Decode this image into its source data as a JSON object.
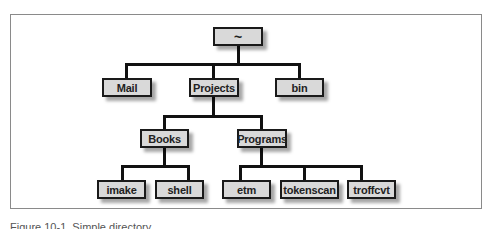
{
  "figure": {
    "caption": "Figure 10-1. Simple directory"
  },
  "tree": {
    "root": {
      "label": "~"
    },
    "level1": [
      {
        "label": "Mail"
      },
      {
        "label": "Projects"
      },
      {
        "label": "bin"
      }
    ],
    "level2": [
      {
        "label": "Books"
      },
      {
        "label": "Programs"
      }
    ],
    "level3_books": [
      {
        "label": "imake"
      },
      {
        "label": "shell"
      }
    ],
    "level3_programs": [
      {
        "label": "etm"
      },
      {
        "label": "tokenscan"
      },
      {
        "label": "troffcvt"
      }
    ]
  },
  "colors": {
    "node_fill": "#d9d9d9",
    "node_border": "#1a1a1a",
    "frame_border": "#8a8a8a"
  }
}
